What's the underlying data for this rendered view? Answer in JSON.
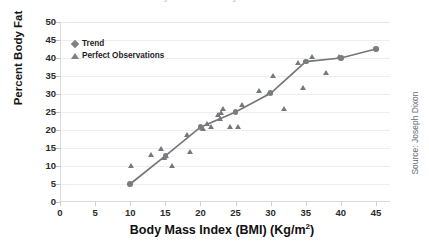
{
  "figure": {
    "title_cutoff": "Percent Body Fat versus Body Mass Index in Adults",
    "source_note": "Source: Joseph Dixon"
  },
  "legend": {
    "position": "top-left-inside",
    "entries": [
      {
        "label": "Trend",
        "marker": "diamond-icon",
        "color": "#7e8083"
      },
      {
        "label": "Perfect Observations",
        "marker": "triangle-icon",
        "color": "#7e8083"
      }
    ]
  },
  "colors": {
    "marker": "#76787c",
    "trend_line": "#74767a",
    "gridline": "#ecedf0",
    "axis": "#d9dadd",
    "text": "#2b2b2b"
  },
  "chart_data": {
    "type": "scatter",
    "title": "Percent Body Fat versus Body Mass Index in Adults",
    "xlabel": "Body Mass Index (BMI) (Kg/m2)",
    "ylabel": "Percent Body Fat",
    "xlim": [
      0,
      47
    ],
    "ylim": [
      0,
      50
    ],
    "xticks": [
      0,
      5,
      10,
      15,
      20,
      25,
      30,
      35,
      40,
      45
    ],
    "yticks": [
      0,
      5,
      10,
      15,
      20,
      25,
      30,
      35,
      40,
      45,
      50
    ],
    "grid": "horizontal",
    "series": [
      {
        "name": "Trend",
        "type": "line",
        "marker": "diamond",
        "points": [
          {
            "x": 10.0,
            "y": 5.0
          },
          {
            "x": 15.0,
            "y": 12.8
          },
          {
            "x": 20.0,
            "y": 20.8
          },
          {
            "x": 25.0,
            "y": 25.0
          },
          {
            "x": 30.0,
            "y": 30.2
          },
          {
            "x": 35.0,
            "y": 39.0
          },
          {
            "x": 40.0,
            "y": 40.0
          },
          {
            "x": 45.0,
            "y": 42.5
          }
        ]
      },
      {
        "name": "Perfect Observations",
        "type": "scatter",
        "marker": "triangle",
        "points": [
          {
            "x": 10.2,
            "y": 10.0
          },
          {
            "x": 13.0,
            "y": 13.0
          },
          {
            "x": 14.4,
            "y": 14.8
          },
          {
            "x": 14.8,
            "y": 12.2
          },
          {
            "x": 15.2,
            "y": 12.8
          },
          {
            "x": 16.0,
            "y": 10.0
          },
          {
            "x": 18.2,
            "y": 18.8
          },
          {
            "x": 18.6,
            "y": 14.0
          },
          {
            "x": 20.4,
            "y": 20.2
          },
          {
            "x": 21.0,
            "y": 21.8
          },
          {
            "x": 21.6,
            "y": 21.0
          },
          {
            "x": 22.6,
            "y": 24.2
          },
          {
            "x": 22.8,
            "y": 23.0
          },
          {
            "x": 23.0,
            "y": 24.8
          },
          {
            "x": 23.2,
            "y": 26.0
          },
          {
            "x": 24.2,
            "y": 21.0
          },
          {
            "x": 25.4,
            "y": 21.0
          },
          {
            "x": 26.0,
            "y": 27.0
          },
          {
            "x": 28.4,
            "y": 30.8
          },
          {
            "x": 29.8,
            "y": 30.2
          },
          {
            "x": 30.4,
            "y": 35.0
          },
          {
            "x": 32.0,
            "y": 26.0
          },
          {
            "x": 34.0,
            "y": 38.8
          },
          {
            "x": 34.6,
            "y": 31.8
          },
          {
            "x": 36.0,
            "y": 40.2
          },
          {
            "x": 38.0,
            "y": 35.8
          },
          {
            "x": 39.8,
            "y": 40.2
          }
        ]
      }
    ]
  }
}
